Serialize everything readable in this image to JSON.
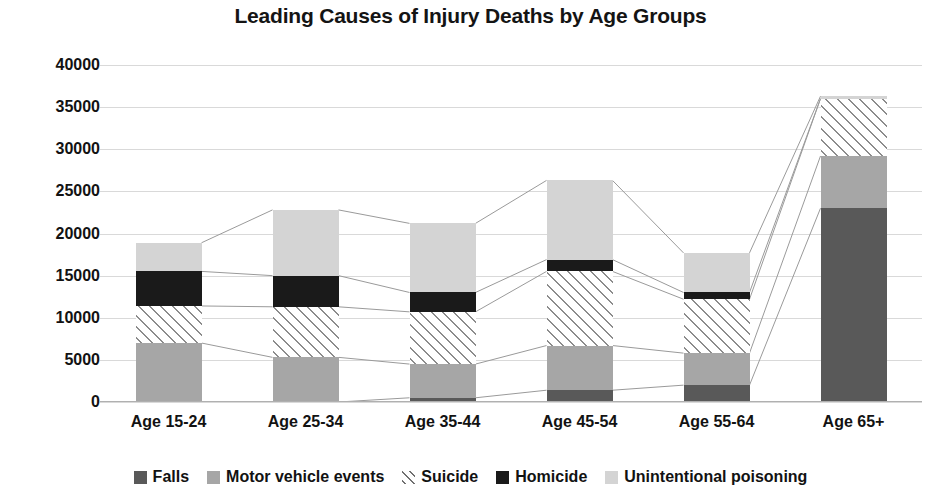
{
  "chart_data": {
    "type": "bar",
    "subtype": "stacked-bar-with-band-connectors",
    "title": "Leading Causes of Injury Deaths by Age Groups",
    "xlabel": "",
    "ylabel": "",
    "ylim": [
      0,
      40000
    ],
    "ytick_step": 5000,
    "yticks": [
      40000,
      35000,
      30000,
      25000,
      20000,
      15000,
      10000,
      5000,
      0
    ],
    "ytick_labels": [
      "40000",
      "35000",
      "30000",
      "25000",
      "20000",
      "15000",
      "10000",
      "5000",
      "0"
    ],
    "grid": true,
    "legend_position": "bottom",
    "categories": [
      "Age 15-24",
      "Age 25-34",
      "Age 35-44",
      "Age 45-54",
      "Age 55-64",
      "Age 65+"
    ],
    "series": [
      {
        "name": "Falls",
        "color": "#595959",
        "pattern": "solid",
        "values": [
          0,
          0,
          500,
          1400,
          2000,
          23000
        ]
      },
      {
        "name": "Motor vehicle events",
        "color": "#a6a6a6",
        "pattern": "solid",
        "values": [
          7000,
          5300,
          4000,
          5300,
          3800,
          6200
        ]
      },
      {
        "name": "Suicide",
        "color": "#8c8c8c",
        "pattern": "diagonal-hatch",
        "values": [
          4400,
          6000,
          6200,
          8800,
          6400,
          6800
        ]
      },
      {
        "name": "Homicide",
        "color": "#1a1a1a",
        "pattern": "solid",
        "values": [
          4100,
          3700,
          2300,
          1400,
          800,
          0
        ]
      },
      {
        "name": "Unintentional poisoning",
        "color": "#d4d4d4",
        "pattern": "solid",
        "values": [
          3400,
          7800,
          8200,
          9400,
          4700,
          300
        ]
      }
    ],
    "totals": [
      18900,
      22800,
      21200,
      26300,
      17700,
      36300
    ],
    "annotations": []
  },
  "legend": {
    "items": [
      {
        "label": "Falls",
        "swatch": "falls-swatch"
      },
      {
        "label": "Motor vehicle events",
        "swatch": "motor-vehicle-swatch"
      },
      {
        "label": "Suicide",
        "swatch": "suicide-swatch"
      },
      {
        "label": "Homicide",
        "swatch": "homicide-swatch"
      },
      {
        "label": "Unintentional poisoning",
        "swatch": "unintentional-poisoning-swatch"
      }
    ]
  },
  "colors": {
    "background": "#ffffff",
    "text": "#121212",
    "gridline": "#d9d9d9",
    "connector": "#9a9a9a"
  }
}
